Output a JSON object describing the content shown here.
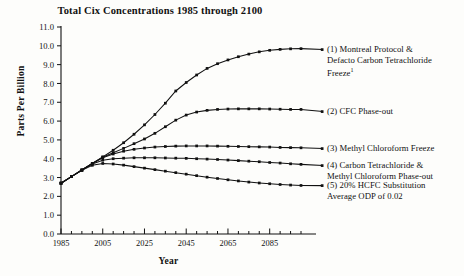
{
  "chart_data": {
    "type": "line",
    "title": "Total Cix Concentrations 1985 through 2100",
    "xlabel": "Year",
    "ylabel": "Parts Per Billion",
    "xlim": [
      1985,
      2100
    ],
    "ylim": [
      0.0,
      11.0
    ],
    "ytick_step": 1.0,
    "xtick_major_step": 20,
    "xtick_minor_step": 5,
    "grid": false,
    "legend_position": "right",
    "marker": "square",
    "yticks": [
      "0.0",
      "1.0",
      "2.0",
      "3.0",
      "4.0",
      "5.0",
      "6.0",
      "7.0",
      "8.0",
      "9.0",
      "10.0",
      "11.0"
    ],
    "xticks": [
      "1985",
      "2005",
      "2025",
      "2045",
      "2065",
      "2085"
    ],
    "x": [
      1985,
      1990,
      1995,
      2000,
      2005,
      2010,
      2015,
      2020,
      2025,
      2030,
      2035,
      2040,
      2045,
      2050,
      2055,
      2060,
      2065,
      2070,
      2075,
      2080,
      2085,
      2090,
      2095,
      2100
    ],
    "series": [
      {
        "name": "(1) Montreal Protocol & Defacto Carbon Tetrachloride Freeze",
        "label_lines": [
          "(1) Montreal Protocol &",
          "Defacto Carbon Tetrachloride",
          "Freeze"
        ],
        "superscript": "1",
        "values": [
          2.7,
          3.05,
          3.4,
          3.75,
          4.1,
          4.45,
          4.85,
          5.3,
          5.8,
          6.35,
          6.95,
          7.6,
          8.05,
          8.45,
          8.8,
          9.05,
          9.25,
          9.42,
          9.56,
          9.68,
          9.76,
          9.81,
          9.84,
          9.85
        ]
      },
      {
        "name": "(2) CFC Phase-out",
        "label_lines": [
          "(2) CFC Phase-out"
        ],
        "values": [
          2.7,
          3.05,
          3.4,
          3.75,
          4.08,
          4.32,
          4.55,
          4.8,
          5.05,
          5.35,
          5.7,
          6.05,
          6.32,
          6.48,
          6.57,
          6.62,
          6.64,
          6.65,
          6.65,
          6.65,
          6.64,
          6.63,
          6.62,
          6.62
        ]
      },
      {
        "name": "(3) Methyl Chloroform Freeze",
        "label_lines": [
          "(3) Methyl Chloroform Freeze"
        ],
        "values": [
          2.7,
          3.05,
          3.4,
          3.75,
          4.05,
          4.25,
          4.4,
          4.5,
          4.57,
          4.62,
          4.65,
          4.67,
          4.68,
          4.68,
          4.68,
          4.67,
          4.66,
          4.65,
          4.64,
          4.63,
          4.62,
          4.6,
          4.59,
          4.58
        ]
      },
      {
        "name": "(4) Carbon Tetrachloride & Methyl Chloroform Phase-out",
        "label_lines": [
          "(4) Carbon Tetrachloride &",
          "Methyl Chloroform Phase-out"
        ],
        "values": [
          2.7,
          3.05,
          3.4,
          3.72,
          3.92,
          4.0,
          4.03,
          4.05,
          4.05,
          4.05,
          4.04,
          4.03,
          4.02,
          4.0,
          3.98,
          3.96,
          3.93,
          3.9,
          3.87,
          3.84,
          3.8,
          3.77,
          3.73,
          3.7
        ]
      },
      {
        "name": "(5) 20% HCFC Substitution Average ODP of 0.02",
        "label_lines": [
          "(5) 20% HCFC Substitution",
          "Average ODP of 0.02"
        ],
        "values": [
          2.7,
          3.05,
          3.38,
          3.65,
          3.75,
          3.72,
          3.66,
          3.58,
          3.5,
          3.42,
          3.34,
          3.26,
          3.18,
          3.1,
          3.02,
          2.95,
          2.88,
          2.82,
          2.76,
          2.71,
          2.67,
          2.63,
          2.6,
          2.58
        ]
      }
    ]
  },
  "colors": {
    "line": "#111111",
    "axis": "#111111",
    "background": "#fdfdfb"
  }
}
